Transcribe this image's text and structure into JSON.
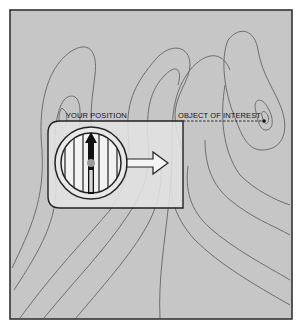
{
  "diagram": {
    "type": "topographic map with compass",
    "labels": {
      "your_position": "YOUR POSITION",
      "object_of_interest": "OBJECT OF INTEREST"
    },
    "colors": {
      "map_background": "#c6c6c6",
      "contour_line": "#6e6e6e",
      "frame": "#333333",
      "compass_plate": "#e4e4e4",
      "needle": "#111111",
      "needle_pivot": "#9a9a9a"
    }
  }
}
